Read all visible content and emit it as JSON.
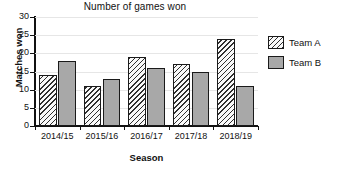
{
  "chart_data": {
    "type": "bar",
    "title": "Number of games won",
    "xlabel": "Season",
    "ylabel": "Matches won",
    "categories": [
      "2014/15",
      "2015/16",
      "2016/17",
      "2017/18",
      "2018/19"
    ],
    "series": [
      {
        "name": "Team A",
        "values": [
          14,
          11,
          19,
          17,
          24
        ],
        "fill": "diagonal-hatch",
        "color": "#b5b5b5"
      },
      {
        "name": "Team B",
        "values": [
          18,
          13,
          16,
          15,
          11
        ],
        "fill": "solid",
        "color": "#a8a8a8"
      }
    ],
    "ylim": [
      0,
      30
    ],
    "yticks": [
      0,
      5,
      10,
      15,
      20,
      25,
      30
    ],
    "ytick_labels": [
      "0",
      "5",
      "10",
      "15",
      "20",
      "25",
      "30"
    ],
    "grid": true,
    "grid_axis": "y",
    "legend_position": "right"
  }
}
